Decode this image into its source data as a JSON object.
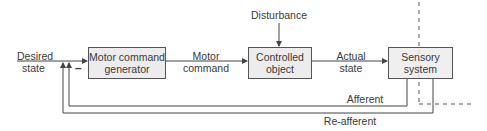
{
  "diagram": {
    "type": "block-diagram",
    "colors": {
      "line": "#444444",
      "box_fill": "#ececec",
      "box_border": "#555555",
      "dashed": "#aaaaaa",
      "text": "#3a3a3a"
    },
    "boxes": [
      {
        "id": "motor-command-generator",
        "line1": "Motor command",
        "line2": "generator"
      },
      {
        "id": "controlled-object",
        "line1": "Controlled",
        "line2": "object"
      },
      {
        "id": "sensory-system",
        "line1": "Sensory",
        "line2": "system"
      }
    ],
    "labels": {
      "desired_state_1": "Desired",
      "desired_state_2": "state",
      "motor_command_1": "Motor",
      "motor_command_2": "command",
      "actual_state_1": "Actual",
      "actual_state_2": "state",
      "disturbance": "Disturbance",
      "afferent": "Afferent",
      "reafferent": "Re-afferent",
      "minus_sign": "–"
    },
    "edges": [
      {
        "from": "Desired state",
        "to": "motor-command-generator"
      },
      {
        "from": "motor-command-generator",
        "to": "controlled-object",
        "label": "Motor command"
      },
      {
        "from": "Disturbance",
        "to": "controlled-object"
      },
      {
        "from": "controlled-object",
        "to": "sensory-system",
        "label": "Actual state"
      },
      {
        "from": "sensory-system",
        "to": "summing-junction",
        "label": "Afferent"
      },
      {
        "from": "sensory-system",
        "to": "summing-junction",
        "label": "Re-afferent"
      }
    ]
  }
}
